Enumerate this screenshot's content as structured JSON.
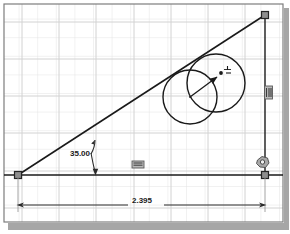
{
  "app": {
    "title": "Sketch Viewport",
    "background_color": "#ffffff",
    "grid_color": "#dcdcdc",
    "grid_major_color": "#c9c9c9",
    "geometry_color": "#1a1a1a",
    "shadow_color": "#9a9a9a"
  },
  "viewport": {
    "grid_spacing_px": 18.6,
    "major_grid_every": 1,
    "border_color": "#808080"
  },
  "dimensions": {
    "angle": {
      "value": "35.00",
      "type": "angular",
      "units": "degrees",
      "label": "35.00"
    },
    "length": {
      "value": "2.395",
      "type": "linear",
      "units": "inches",
      "label": "2.395"
    }
  },
  "sketch": {
    "triangle": {
      "vertex_origin": {
        "x": 18,
        "y": 175
      },
      "vertex_right": {
        "x": 265,
        "y": 15
      },
      "vertex_corner": {
        "x": 265,
        "y": 175
      }
    },
    "circles": [
      {
        "name": "circle-left",
        "cx": 190,
        "cy": 97,
        "r": 27
      },
      {
        "name": "circle-right",
        "cx": 216,
        "cy": 83,
        "r": 29
      }
    ],
    "radius_arrow": {
      "from": {
        "x": 190,
        "y": 97
      },
      "to": {
        "x": 219,
        "y": 75
      }
    },
    "cursor": {
      "x": 221,
      "y": 74
    }
  },
  "constraints": [
    {
      "name": "vertical-constraint",
      "icon": "vertical-icon",
      "x": 268,
      "y": 92
    },
    {
      "name": "horizontal-constraint",
      "icon": "horizontal-icon",
      "x": 137,
      "y": 164
    },
    {
      "name": "coincident-constraint",
      "icon": "coincident-icon",
      "x": 262,
      "y": 163
    }
  ],
  "vertices": [
    {
      "name": "vertex-origin-handle",
      "x": 18,
      "y": 175
    },
    {
      "name": "vertex-top-handle",
      "x": 265,
      "y": 15
    },
    {
      "name": "vertex-corner-handle",
      "x": 265,
      "y": 175
    }
  ]
}
